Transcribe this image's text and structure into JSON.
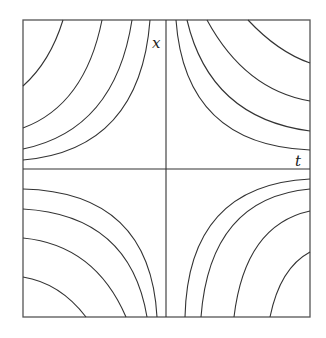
{
  "diagram": {
    "type": "phase-portrait",
    "colors": {
      "line": "#333333",
      "frame": "#555555",
      "background": "#ffffff"
    },
    "frame": {
      "x0": 23,
      "y0": 20,
      "x1": 310,
      "y1": 317
    },
    "origin": {
      "x": 166,
      "y": 169
    },
    "axes": {
      "vertical_label": "x",
      "horizontal_label": "t"
    },
    "curves": {
      "top_left": [
        {
          "start": [
            23,
            86
          ],
          "end": [
            63,
            20
          ],
          "ctrl": [
            50,
            62
          ]
        },
        {
          "start": [
            23,
            128
          ],
          "end": [
            102,
            20
          ],
          "ctrl": [
            85,
            105
          ]
        },
        {
          "start": [
            23,
            149
          ],
          "end": [
            132,
            20
          ],
          "ctrl": [
            115,
            130
          ]
        },
        {
          "start": [
            23,
            160
          ],
          "end": [
            150,
            20
          ],
          "ctrl": [
            140,
            150
          ]
        }
      ],
      "top_right": [
        {
          "start": [
            176,
            20
          ],
          "end": [
            310,
            150
          ],
          "ctrl": [
            185,
            145
          ]
        },
        {
          "start": [
            187,
            20
          ],
          "end": [
            310,
            131
          ],
          "ctrl": [
            210,
            118
          ]
        },
        {
          "start": [
            207,
            20
          ],
          "end": [
            310,
            101
          ],
          "ctrl": [
            245,
            90
          ]
        },
        {
          "start": [
            248,
            20
          ],
          "end": [
            310,
            63
          ],
          "ctrl": [
            278,
            52
          ]
        }
      ],
      "bottom_left": [
        {
          "start": [
            23,
            189
          ],
          "end": [
            157,
            317
          ],
          "ctrl": [
            150,
            192
          ]
        },
        {
          "start": [
            23,
            209
          ],
          "end": [
            147,
            317
          ],
          "ctrl": [
            130,
            215
          ]
        },
        {
          "start": [
            23,
            238
          ],
          "end": [
            126,
            317
          ],
          "ctrl": [
            95,
            245
          ]
        },
        {
          "start": [
            23,
            277
          ],
          "end": [
            86,
            317
          ],
          "ctrl": [
            60,
            283
          ]
        }
      ],
      "bottom_right": [
        {
          "start": [
            185,
            317
          ],
          "end": [
            310,
            179
          ],
          "ctrl": [
            188,
            185
          ]
        },
        {
          "start": [
            201,
            317
          ],
          "end": [
            310,
            189
          ],
          "ctrl": [
            210,
            198
          ]
        },
        {
          "start": [
            234,
            317
          ],
          "end": [
            310,
            211
          ],
          "ctrl": [
            245,
            225
          ]
        },
        {
          "start": [
            270,
            317
          ],
          "end": [
            310,
            252
          ],
          "ctrl": [
            280,
            268
          ]
        }
      ]
    }
  }
}
